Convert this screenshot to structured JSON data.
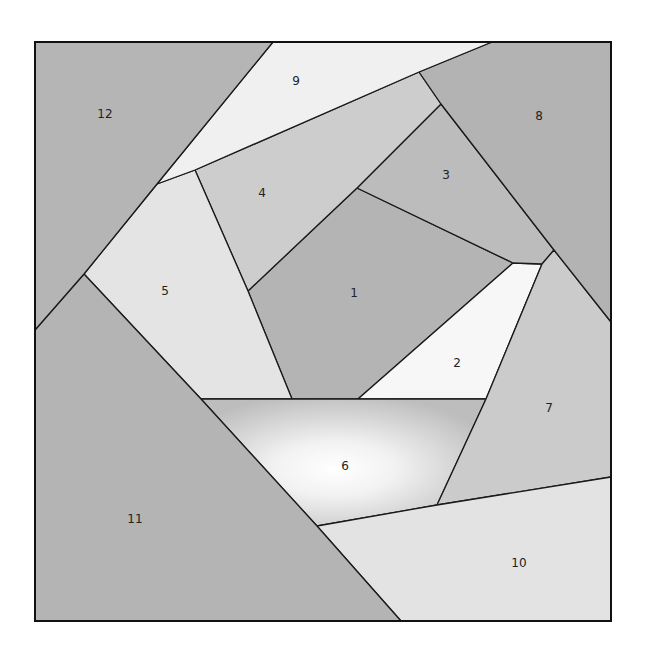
{
  "diagram": {
    "type": "paper-piecing quilt block",
    "frame": {
      "x": 35,
      "y": 42,
      "width": 576,
      "height": 579
    },
    "pieces": [
      {
        "id": "1",
        "label": "1",
        "fill": "#b4b4b4",
        "points": "357,188 513,263 358,399 292,399 248,291",
        "label_pos": [
          354,
          293
        ]
      },
      {
        "id": "2",
        "label": "2",
        "fill": "#f7f7f7",
        "points": "513,263 542,264 486,399 358,399",
        "label_pos": [
          457,
          363
        ]
      },
      {
        "id": "3",
        "label": "3",
        "fill": "#bcbcbc",
        "points": "441,104 554,250 542,264 513,263 357,188",
        "label_pos": [
          446,
          175
        ]
      },
      {
        "id": "4",
        "label": "4",
        "fill": "#cdcdcd",
        "points": "195,170 419,72 441,104 357,188 248,291",
        "label_pos": [
          262,
          193
        ]
      },
      {
        "id": "5",
        "label": "5",
        "fill": "#e4e4e4",
        "points": "157,184 195,170 248,291 292,399 201,399 84,274",
        "label_pos": [
          165,
          291
        ]
      },
      {
        "id": "6",
        "label": "6",
        "fill": "url(#glow6)",
        "points": "201,399 486,399 437,505 317,526",
        "label_pos": [
          345,
          466
        ]
      },
      {
        "id": "7",
        "label": "7",
        "fill": "#cbcbcb",
        "points": "554,250 611,322 611,477 437,505 486,399 542,264",
        "label_pos": [
          549,
          408
        ]
      },
      {
        "id": "8",
        "label": "8",
        "fill": "#b3b3b3",
        "points": "492,42 611,42 611,322 554,250 441,104 419,72",
        "label_pos": [
          539,
          116
        ]
      },
      {
        "id": "9",
        "label": "9",
        "fill": "#f0f0f0",
        "points": "273,42 492,42 419,72 195,170 157,184",
        "label_pos": [
          296,
          81
        ]
      },
      {
        "id": "10",
        "label": "10",
        "fill": "#e3e3e3",
        "points": "317,526 437,505 611,477 611,621 401,621",
        "label_pos": [
          519,
          563
        ]
      },
      {
        "id": "11",
        "label": "11",
        "fill": "#b4b4b4",
        "points": "35,330 84,274 201,399 317,526 401,621 35,621",
        "label_pos": [
          135,
          519
        ]
      },
      {
        "id": "12",
        "label": "12",
        "fill": "#b5b5b5",
        "points": "35,42 273,42 157,184 84,274 35,330",
        "label_pos": [
          105,
          114
        ]
      }
    ]
  }
}
